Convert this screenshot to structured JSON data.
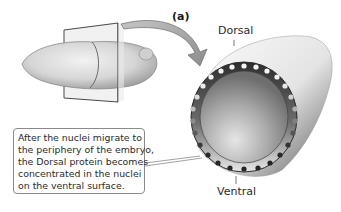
{
  "figure": {
    "panel_label": "(a)",
    "labels": {
      "dorsal": "Dorsal",
      "ventral": "Ventral"
    },
    "callout": {
      "lines": [
        "After the nuclei migrate to",
        "the periphery of the embryo,",
        "the Dorsal protein becomes",
        "concentrated in the nuclei",
        "on the ventral surface."
      ]
    },
    "elements": [
      "whole-embryo-with-section-plane",
      "curved-arrow",
      "embryo-cross-section",
      "peripheral-nuclei-ring"
    ],
    "colors": {
      "embryo_fill": "#d9d9d9",
      "plane_stroke": "#444444",
      "arrow_fill": "#a8a8a8",
      "ring_fill": "#3a3a3a",
      "nucleus_light": "#f4f4f4",
      "nucleus_dark": "#262626",
      "cytoplasm": "#9a9a9a"
    }
  }
}
